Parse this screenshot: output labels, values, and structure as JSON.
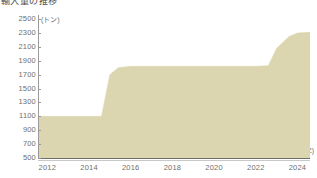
{
  "title": "輸入量の推移",
  "axes": {
    "y_unit": "(トン)",
    "x_unit": "(年)",
    "y_ticks": [
      500,
      700,
      900,
      1100,
      1300,
      1500,
      1700,
      1900,
      2100,
      2300,
      2500
    ],
    "x_ticks": [
      2012,
      2014,
      2016,
      2018,
      2020,
      2022,
      2024
    ],
    "ylim": [
      500,
      2560
    ],
    "xlim": [
      2011.6,
      2024.6
    ]
  },
  "style": {
    "fill_color": "#dcd6b0",
    "axis_color": "#9a9a9a",
    "baseline_color": "#6d6d6d",
    "text_color": "#6e6e6e",
    "background": "#ffffff"
  },
  "chart_data": {
    "type": "area",
    "title": "輸入量の推移",
    "xlabel": "(年)",
    "ylabel": "(トン)",
    "ylim": [
      500,
      2560
    ],
    "xlim": [
      2011.6,
      2024.6
    ],
    "grid": false,
    "legend": "none",
    "x": [
      2011.6,
      2012,
      2013,
      2014,
      2014.6,
      2015,
      2015.4,
      2016,
      2017,
      2018,
      2019,
      2020,
      2021,
      2022,
      2022.6,
      2023,
      2023.6,
      2024,
      2024.6
    ],
    "values": [
      1100,
      1100,
      1100,
      1100,
      1100,
      1700,
      1800,
      1820,
      1820,
      1820,
      1820,
      1820,
      1820,
      1820,
      1830,
      2080,
      2250,
      2300,
      2310
    ],
    "series": [
      {
        "name": "輸入量",
        "values": [
          1100,
          1100,
          1100,
          1100,
          1100,
          1700,
          1800,
          1820,
          1820,
          1820,
          1820,
          1820,
          1820,
          1820,
          1830,
          2080,
          2250,
          2300,
          2310
        ]
      }
    ],
    "annotations": []
  }
}
